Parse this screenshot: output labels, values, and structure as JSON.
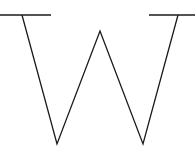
{
  "figure": {
    "stroke_color": "#1a1a1a",
    "background": "#ffffff",
    "width": 195,
    "height": 152,
    "paths": {
      "w_stroke": "M22,15 L57,144 L100,31 L143,144 L178,15",
      "left_serif": "M0,15 L51,15",
      "right_serif": "M149,15 L195,15"
    }
  }
}
